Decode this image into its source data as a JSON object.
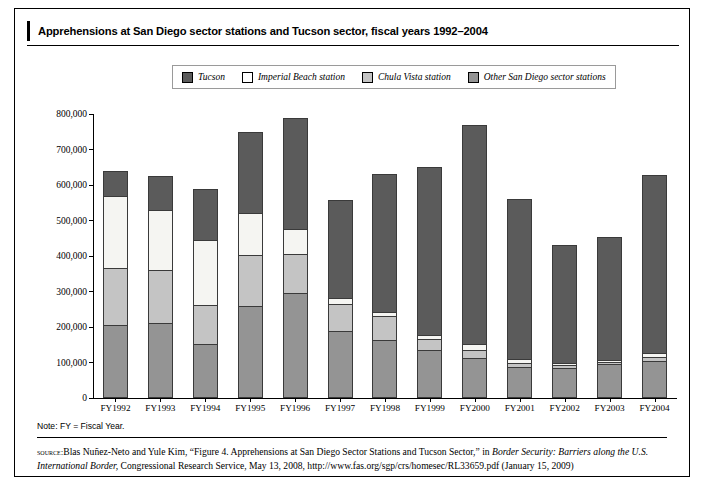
{
  "figure": {
    "title": "Apprehensions at San Diego sector stations and Tucson sector, fiscal years 1992–2004",
    "note": "Note: FY = Fiscal Year.",
    "source_label": "source:",
    "source_part1": "Blas Nuñez-Neto and Yule Kim, “Figure 4. Apprehensions at San Diego Sector Stations and Tucson Sector,” in ",
    "source_italic1": "Border Security: Barriers along the U.S. International Border,",
    "source_part2": " Congressional Research Service, May 13, 2008, http://www.fas.org/sgp/crs/homesec/RL33659.pdf (January 15, 2009)"
  },
  "legend": {
    "items": [
      {
        "label": "Tucson",
        "color": "#5b5b5b",
        "key": "tucson"
      },
      {
        "label": "Imperial Beach station",
        "color": "#ffffff",
        "key": "imperial_beach"
      },
      {
        "label": "Chula Vista station",
        "color": "#c4c4c4",
        "key": "chula_vista"
      },
      {
        "label": "Other San Diego sector stations",
        "color": "#949494",
        "key": "other_san_diego"
      }
    ]
  },
  "chart_data": {
    "type": "bar",
    "stacked": true,
    "title": "Apprehensions at San Diego sector stations and Tucson sector, fiscal years 1992–2004",
    "xlabel": "",
    "ylabel": "",
    "ylim": [
      0,
      800000
    ],
    "ytick_values": [
      0,
      100000,
      200000,
      300000,
      400000,
      500000,
      600000,
      700000,
      800000
    ],
    "ytick_labels": [
      "0",
      "100,000",
      "200,000",
      "300,000",
      "400,000",
      "500,000",
      "600,000",
      "700,000",
      "800,000"
    ],
    "grid": false,
    "legend_position": "top",
    "categories": [
      "FY1992",
      "FY1993",
      "FY1994",
      "FY1995",
      "FY1996",
      "FY1997",
      "FY1998",
      "FY1999",
      "FY2000",
      "FY2001",
      "FY2002",
      "FY2003",
      "FY2004"
    ],
    "stack_order_bottom_to_top": [
      "other_san_diego",
      "chula_vista",
      "imperial_beach",
      "tucson"
    ],
    "series": [
      {
        "name": "Other San Diego sector stations",
        "key": "other_san_diego",
        "color": "#949494",
        "values": [
          205000,
          210000,
          153000,
          260000,
          295000,
          190000,
          163000,
          135000,
          113000,
          88000,
          85000,
          95000,
          105000
        ]
      },
      {
        "name": "Chula Vista station",
        "key": "chula_vista",
        "color": "#c4c4c4",
        "values": [
          160000,
          150000,
          110000,
          142000,
          112000,
          75000,
          68000,
          30000,
          22000,
          10000,
          7000,
          6000,
          10000
        ]
      },
      {
        "name": "Imperial Beach station",
        "key": "imperial_beach",
        "color": "#f5f5f2",
        "values": [
          205000,
          170000,
          183000,
          120000,
          70000,
          17000,
          12000,
          12000,
          18000,
          12000,
          8000,
          7000,
          12000
        ]
      },
      {
        "name": "Tucson",
        "key": "tucson",
        "color": "#5b5b5b",
        "values": [
          70000,
          95000,
          144000,
          228000,
          313000,
          275000,
          387000,
          473000,
          617000,
          450000,
          330000,
          347000,
          501000
        ]
      }
    ],
    "totals": [
      640000,
      625000,
      590000,
      750000,
      790000,
      557000,
      630000,
      650000,
      770000,
      560000,
      430000,
      455000,
      628000
    ]
  }
}
